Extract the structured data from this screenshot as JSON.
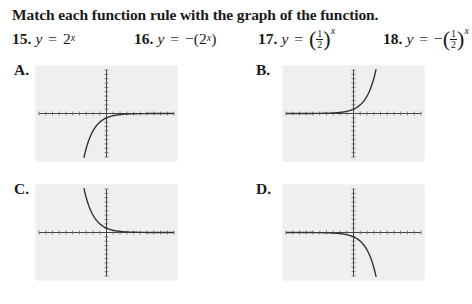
{
  "title": "Match each function rule with the graph of the function.",
  "functions": [
    {
      "number": "15.",
      "lhs": "y",
      "eq": "=",
      "neg": "",
      "base": "2",
      "exponent": "x",
      "fraction": false
    },
    {
      "number": "16.",
      "lhs": "y",
      "eq": "=",
      "neg": "−",
      "base": "2",
      "exponent": "x",
      "fraction": false
    },
    {
      "number": "17.",
      "lhs": "y",
      "eq": "=",
      "neg": "",
      "numerator": "1",
      "denominator": "2",
      "exponent": "x",
      "fraction": true
    },
    {
      "number": "18.",
      "lhs": "y",
      "eq": "=",
      "neg": "−",
      "numerator": "1",
      "denominator": "2",
      "exponent": "x",
      "fraction": true
    }
  ],
  "graphs": [
    {
      "label": "A.",
      "description": "decreasing curve below x-axis approaching 0 from left to right (reflected (1/2)^x)"
    },
    {
      "label": "B.",
      "description": "increasing curve above x-axis, rising steeply to right"
    },
    {
      "label": "C.",
      "description": "decreasing curve above x-axis, steep on left, approaching 0 on right"
    },
    {
      "label": "D.",
      "description": "curve below x-axis, near 0 on left, falling steeply to right"
    }
  ],
  "chart_data": [
    {
      "type": "line",
      "title": "A.",
      "function": "y = -(1/2)^x",
      "xlim": [
        -10,
        10
      ],
      "ylim": [
        -10,
        10
      ],
      "xscale": 1,
      "yscale": 1,
      "grid": false,
      "x": [
        -3.3,
        -3,
        -2,
        -1,
        0,
        1,
        2,
        3,
        5,
        10
      ],
      "y": [
        -9.8,
        -8,
        -4,
        -2,
        -1,
        -0.5,
        -0.25,
        -0.125,
        -0.03,
        0
      ]
    },
    {
      "type": "line",
      "title": "B.",
      "function": "y = 2^x",
      "xlim": [
        -10,
        10
      ],
      "ylim": [
        -10,
        10
      ],
      "xscale": 1,
      "yscale": 1,
      "grid": false,
      "x": [
        -10,
        -5,
        -3,
        -2,
        -1,
        0,
        1,
        2,
        3,
        3.3
      ],
      "y": [
        0,
        0.03,
        0.125,
        0.25,
        0.5,
        1,
        2,
        4,
        8,
        9.8
      ]
    },
    {
      "type": "line",
      "title": "C.",
      "function": "y = (1/2)^x",
      "xlim": [
        -10,
        10
      ],
      "ylim": [
        -10,
        10
      ],
      "xscale": 1,
      "yscale": 1,
      "grid": false,
      "x": [
        -3.3,
        -3,
        -2,
        -1,
        0,
        1,
        2,
        3,
        5,
        10
      ],
      "y": [
        9.8,
        8,
        4,
        2,
        1,
        0.5,
        0.25,
        0.125,
        0.03,
        0
      ]
    },
    {
      "type": "line",
      "title": "D.",
      "function": "y = -(2^x)",
      "xlim": [
        -10,
        10
      ],
      "ylim": [
        -10,
        10
      ],
      "xscale": 1,
      "yscale": 1,
      "grid": false,
      "x": [
        -10,
        -5,
        -3,
        -2,
        -1,
        0,
        1,
        2,
        3,
        3.3
      ],
      "y": [
        0,
        -0.03,
        -0.125,
        -0.25,
        -0.5,
        -1,
        -2,
        -4,
        -8,
        -9.8
      ]
    }
  ]
}
